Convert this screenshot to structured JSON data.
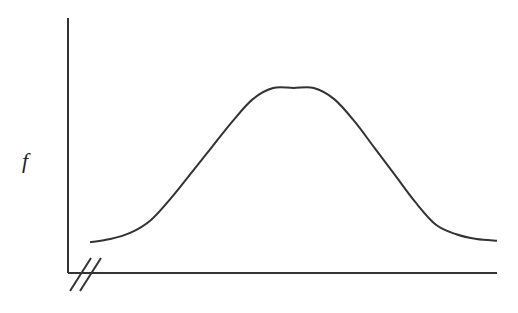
{
  "chart_data": {
    "type": "line",
    "title": "",
    "xlabel": "",
    "ylabel": "f",
    "grid": false,
    "legend": null,
    "axis_break": "x-axis origin (double slash)",
    "x": [
      0,
      0.05,
      0.1,
      0.15,
      0.2,
      0.25,
      0.3,
      0.35,
      0.4,
      0.45,
      0.5,
      0.55,
      0.6,
      0.65,
      0.7,
      0.75,
      0.8,
      0.85,
      0.9,
      0.95,
      1.0
    ],
    "series": [
      {
        "name": "f",
        "values": [
          0.03,
          0.05,
          0.09,
          0.17,
          0.31,
          0.47,
          0.63,
          0.79,
          0.93,
          1.0,
          1.0,
          1.0,
          0.93,
          0.79,
          0.62,
          0.45,
          0.28,
          0.14,
          0.08,
          0.05,
          0.04
        ]
      }
    ],
    "color": "#333333"
  },
  "labels": {
    "y_axis": "f"
  }
}
